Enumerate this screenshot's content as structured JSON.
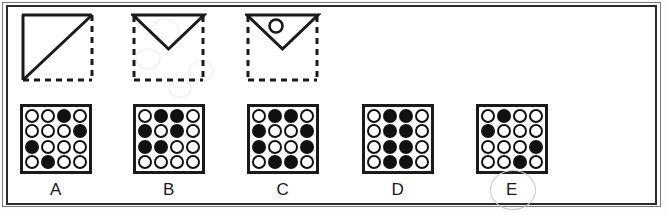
{
  "puzzle": {
    "type": "visual-analogy-matrix",
    "prompt_label": "sequence of folded-paper style figures",
    "prompts": [
      {
        "id": "prompt-1",
        "name": "square-with-diagonal",
        "description": "Square outline: solid top edge, solid left edge, solid diagonal from bottom-left to top-right; dashed right edge and dashed bottom edge",
        "solid_edges": [
          "top",
          "left",
          "diagonal-bl-tr"
        ],
        "dashed_edges": [
          "right",
          "bottom"
        ],
        "inner_mark": "none"
      },
      {
        "id": "prompt-2",
        "name": "downward-triangle",
        "description": "Dashed square outline with a solid downward-pointing triangle occupying the upper half",
        "solid_edges": [
          "triangle-top",
          "triangle-left-slope",
          "triangle-right-slope"
        ],
        "dashed_edges": [
          "left",
          "right",
          "bottom"
        ],
        "inner_mark": "none"
      },
      {
        "id": "prompt-3",
        "name": "downward-triangle-with-circle",
        "description": "Dashed square outline with solid downward-pointing triangle containing a small open circle near the upper-left",
        "solid_edges": [
          "triangle-top",
          "triangle-left-slope",
          "triangle-right-slope"
        ],
        "dashed_edges": [
          "left",
          "right",
          "bottom"
        ],
        "inner_mark": "small-open-circle"
      }
    ],
    "options": [
      {
        "label": "A",
        "name": "option-a",
        "selected": false,
        "grid": [
          [
            0,
            0,
            1,
            0
          ],
          [
            0,
            0,
            0,
            1
          ],
          [
            1,
            0,
            0,
            0
          ],
          [
            0,
            1,
            0,
            0
          ]
        ]
      },
      {
        "label": "B",
        "name": "option-b",
        "selected": false,
        "grid": [
          [
            0,
            1,
            1,
            0
          ],
          [
            1,
            0,
            1,
            0
          ],
          [
            1,
            1,
            0,
            0
          ],
          [
            0,
            0,
            0,
            0
          ]
        ]
      },
      {
        "label": "C",
        "name": "option-c",
        "selected": false,
        "grid": [
          [
            0,
            1,
            1,
            0
          ],
          [
            1,
            0,
            0,
            1
          ],
          [
            1,
            0,
            0,
            1
          ],
          [
            0,
            1,
            1,
            0
          ]
        ]
      },
      {
        "label": "D",
        "name": "option-d",
        "selected": false,
        "grid": [
          [
            0,
            1,
            1,
            0
          ],
          [
            0,
            1,
            1,
            0
          ],
          [
            0,
            1,
            1,
            0
          ],
          [
            0,
            1,
            1,
            0
          ]
        ]
      },
      {
        "label": "E",
        "name": "option-e",
        "selected": true,
        "grid": [
          [
            0,
            1,
            0,
            0
          ],
          [
            1,
            0,
            0,
            0
          ],
          [
            0,
            0,
            0,
            1
          ],
          [
            0,
            0,
            1,
            0
          ]
        ]
      }
    ],
    "colors": {
      "ink": "#111111",
      "frame": "#2b2b2b",
      "outer_frame": "#7a7a7a",
      "paper": "#ffffff",
      "selection_ring": "#c9c9c9"
    }
  }
}
